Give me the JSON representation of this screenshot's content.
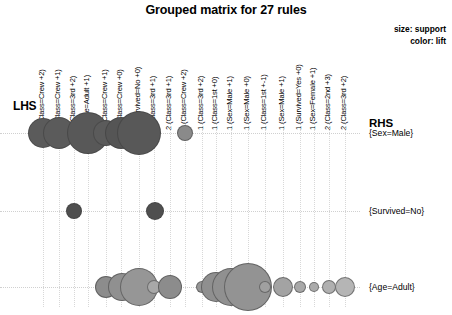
{
  "title": "Grouped matrix for 27 rules",
  "legend": {
    "size_line": "size: support",
    "color_line": "color: lift"
  },
  "axis": {
    "lhs_label": "LHS",
    "rhs_label": "RHS"
  },
  "chart_data": {
    "type": "scatter",
    "title": "Grouped matrix for 27 rules",
    "xlabel": "LHS",
    "ylabel": "RHS",
    "size_encodes": "support",
    "color_encodes": "lift",
    "grid": true,
    "legend_position": "top-right",
    "categories": [
      "1 (Class=Crew +2)",
      "1 (Class=Crew +1)",
      "1 (Class=3rd +2)",
      "1 (Age=Adult +1)",
      "2 (Class=Crew +1)",
      "2 (Class=Crew +0)",
      "2 (Survived=No +0)",
      "2 (Class=3rd +1)",
      "2 (Class=3rd +1)",
      "2 (Class=Crew +2)",
      "1 (Class=3rd +2)",
      "1 (Class=1st +0)",
      "1 (Sex=Male +1)",
      "1 (Sex=Male +0)",
      "1 (Class=1st +-1)",
      "1 (Sex=Male +1)",
      "1 (Survived=Yes +0)",
      "1 (Sex=Female +1)",
      "2 (Class=2nd +3)",
      "2 (Class=3rd +2)",
      "1 (Class=3rd +0)"
    ],
    "rows": [
      "{Sex=Male}",
      "{Survived=No}",
      "{Age=Adult}"
    ],
    "points": [
      {
        "row": 0,
        "col": 0,
        "x": 43,
        "size": 15,
        "lift": "high",
        "color": "#5b5b5b"
      },
      {
        "row": 0,
        "col": 1,
        "x": 59,
        "size": 16,
        "lift": "high",
        "color": "#5b5b5b"
      },
      {
        "row": 0,
        "col": 3,
        "x": 88,
        "size": 21,
        "lift": "high",
        "color": "#585858"
      },
      {
        "row": 0,
        "col": 4,
        "x": 106,
        "size": 13,
        "lift": "high",
        "color": "#5b5b5b"
      },
      {
        "row": 0,
        "col": 5,
        "x": 121,
        "size": 16,
        "lift": "high",
        "color": "#555555"
      },
      {
        "row": 0,
        "col": 6,
        "x": 139,
        "size": 22,
        "lift": "high",
        "color": "#585858"
      },
      {
        "row": 0,
        "col": 9,
        "x": 185,
        "size": 8,
        "lift": "medium",
        "color": "#8a8a8a"
      },
      {
        "row": 1,
        "col": 1,
        "x": 74,
        "size": 8,
        "lift": "high",
        "color": "#4f4f4f"
      },
      {
        "row": 1,
        "col": 6,
        "x": 155,
        "size": 9,
        "lift": "high",
        "color": "#4f4f4f"
      },
      {
        "row": 2,
        "col": 4,
        "x": 106,
        "size": 11,
        "lift": "medium",
        "color": "#8c8c8c"
      },
      {
        "row": 2,
        "col": 5,
        "x": 122,
        "size": 14,
        "lift": "medium",
        "color": "#909090"
      },
      {
        "row": 2,
        "col": 6,
        "x": 139,
        "size": 19,
        "lift": "medium",
        "color": "#969696"
      },
      {
        "row": 2,
        "col": 7,
        "x": 154,
        "size": 7,
        "lift": "low",
        "color": "#a8a8a8"
      },
      {
        "row": 2,
        "col": 8,
        "x": 170,
        "size": 12,
        "lift": "medium",
        "color": "#8c8c8c"
      },
      {
        "row": 2,
        "col": 10,
        "x": 202,
        "size": 6,
        "lift": "medium",
        "color": "#969696"
      },
      {
        "row": 2,
        "col": 11,
        "x": 216,
        "size": 15,
        "lift": "medium",
        "color": "#8f8f8f"
      },
      {
        "row": 2,
        "col": 12,
        "x": 231,
        "size": 19,
        "lift": "medium",
        "color": "#909090"
      },
      {
        "row": 2,
        "col": 13,
        "x": 248,
        "size": 24,
        "lift": "medium",
        "color": "#939393"
      },
      {
        "row": 2,
        "col": 14,
        "x": 265,
        "size": 6,
        "lift": "low",
        "color": "#a0a0a0"
      },
      {
        "row": 2,
        "col": 15,
        "x": 283,
        "size": 10,
        "lift": "low",
        "color": "#a3a3a3"
      },
      {
        "row": 2,
        "col": 16,
        "x": 300,
        "size": 6,
        "lift": "low",
        "color": "#a8a8a8"
      },
      {
        "row": 2,
        "col": 17,
        "x": 314,
        "size": 5,
        "lift": "low",
        "color": "#aaaaaa"
      },
      {
        "row": 2,
        "col": 18,
        "x": 329,
        "size": 7,
        "lift": "low",
        "color": "#b0b0b0"
      },
      {
        "row": 2,
        "col": 19,
        "x": 345,
        "size": 10,
        "lift": "low",
        "color": "#b5b5b5"
      }
    ],
    "row_y": [
      11,
      89,
      165
    ],
    "col_x": [
      43,
      59,
      74,
      88,
      106,
      121,
      139,
      154,
      170,
      185,
      202,
      216,
      231,
      248,
      265,
      283,
      300,
      314,
      329,
      345
    ]
  }
}
